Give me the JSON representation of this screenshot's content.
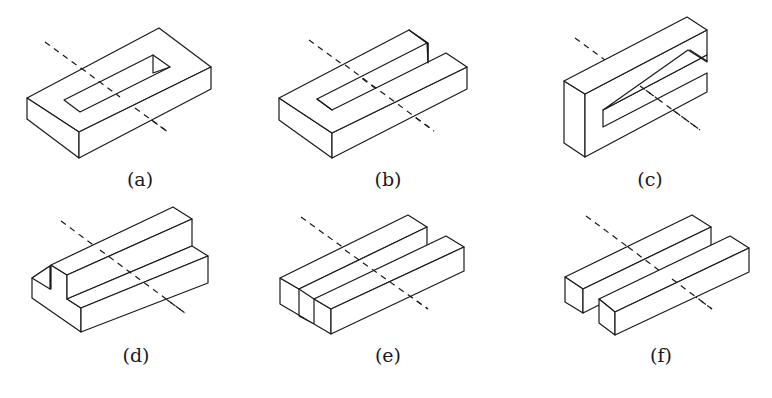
{
  "figure": {
    "panels": [
      {
        "id": "a",
        "label": "(a)",
        "description": "rectangular block with a closed rectangular slot through the top"
      },
      {
        "id": "b",
        "label": "(b)",
        "description": "block with an open slot from the right end (C-shape in plan)"
      },
      {
        "id": "c",
        "label": "(c)",
        "description": "C-shaped section standing vertically"
      },
      {
        "id": "d",
        "label": "(d)",
        "description": "stepped block with a notch at the left end"
      },
      {
        "id": "e",
        "label": "(e)",
        "description": "block with a longitudinal groove (U-channel)"
      },
      {
        "id": "f",
        "label": "(f)",
        "description": "two separate parallel rectangular bars"
      }
    ],
    "style": {
      "line_color": "#1a1a1a",
      "background": "#ffffff",
      "axis_style": "dashed"
    }
  }
}
